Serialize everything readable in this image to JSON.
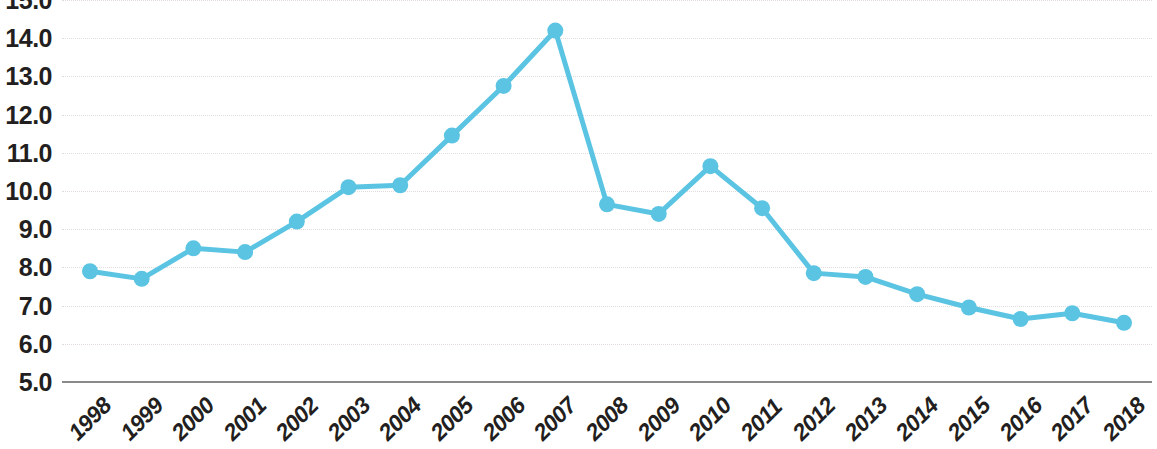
{
  "chart_data": {
    "type": "line",
    "title": "",
    "subtitle": "",
    "xlabel": "",
    "ylabel": "",
    "categories": [
      "1998",
      "1999",
      "2000",
      "2001",
      "2002",
      "2003",
      "2004",
      "2005",
      "2006",
      "2007",
      "2008",
      "2009",
      "2010",
      "2011",
      "2012",
      "2013",
      "2014",
      "2015",
      "2016",
      "2017",
      "2018"
    ],
    "values": [
      7.9,
      7.7,
      8.5,
      8.4,
      9.2,
      10.1,
      10.15,
      11.45,
      12.75,
      14.2,
      9.65,
      9.4,
      10.65,
      9.55,
      7.85,
      7.75,
      7.3,
      6.95,
      6.65,
      6.8,
      6.55
    ],
    "series": [
      {
        "name": "",
        "values": [
          7.9,
          7.7,
          8.5,
          8.4,
          9.2,
          10.1,
          10.15,
          11.45,
          12.75,
          14.2,
          9.65,
          9.4,
          10.65,
          9.55,
          7.85,
          7.75,
          7.3,
          6.95,
          6.65,
          6.8,
          6.55
        ]
      }
    ],
    "ylim": [
      5.0,
      15.0
    ],
    "ytick_step": 1.0,
    "ytick_labels": [
      "15.0",
      "14.0",
      "13.0",
      "12.0",
      "11.0",
      "10.0",
      "9.0",
      "8.0",
      "7.0",
      "6.0",
      "5.0"
    ],
    "ytick_values": [
      15.0,
      14.0,
      13.0,
      12.0,
      11.0,
      10.0,
      9.0,
      8.0,
      7.0,
      6.0,
      5.0
    ],
    "grid": true,
    "grid_style": "dotted",
    "legend": false,
    "legend_position": "none",
    "markers": true,
    "annotations": []
  },
  "style": {
    "series_color": "#5bc4e3",
    "marker_color": "#5bc4e3",
    "grid_color": "#e3dcdc",
    "axis_color": "#8a8a8a",
    "label_color": "#231f20",
    "background": "#ffffff",
    "line_width": 5,
    "marker_radius": 8
  }
}
